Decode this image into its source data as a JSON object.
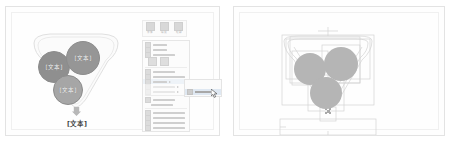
{
  "app": {
    "background_color": "#ffffff",
    "panel_background": "#fefefe",
    "panel_border_color": "#e3e3e3"
  },
  "left_panel": {
    "name": "slide-editing-view",
    "diagram": {
      "type": "funnel-smartart",
      "shape_fill": "#9a9a9a",
      "bubbles": [
        {
          "label": "[文本]",
          "fill": "#8f8f8f"
        },
        {
          "label": "[文本]",
          "fill": "#969696"
        },
        {
          "label": "[文本]",
          "fill": "#a6a6a6"
        }
      ],
      "arrow": {
        "icon": "arrow-down-icon",
        "fill": "#b0b0b0"
      },
      "bottom_label": "[文本]"
    },
    "mini_toolbar": {
      "items": [
        {
          "icon": "font-color-icon",
          "label": "字体"
        },
        {
          "icon": "shape-fill-icon",
          "label": "填充"
        },
        {
          "icon": "shape-outline-icon",
          "label": "轮廓"
        }
      ]
    },
    "context_menu": {
      "paste_options_label": "粘贴选项:",
      "paste_icons": [
        "paste-keep-formatting-icon",
        "paste-picture-icon"
      ],
      "items": [
        {
          "icon": "cut-icon",
          "label": "剪切(T)",
          "width": "s",
          "state": "normal"
        },
        {
          "icon": "copy-icon",
          "label": "复制(C)",
          "width": "s",
          "state": "normal"
        },
        {
          "icon": "paste-icon",
          "label": "粘贴选项:",
          "width": "m",
          "state": "normal"
        },
        {
          "icon": "edit-text-icon",
          "label": "编辑文字(X)",
          "width": "m",
          "state": "normal"
        },
        {
          "icon": "edit-points-icon",
          "label": "编辑顶点(E)",
          "width": "l",
          "state": "normal"
        },
        {
          "icon": "group-icon",
          "label": "组合(G)",
          "width": "s",
          "state": "normal",
          "has_submenu": true,
          "selected": true
        },
        {
          "icon": "bring-to-front-icon",
          "label": "置于顶层(R)",
          "width": "m",
          "state": "disabled",
          "has_submenu": true
        },
        {
          "icon": "send-to-back-icon",
          "label": "置于底层(K)",
          "width": "m",
          "state": "disabled",
          "has_submenu": true
        },
        {
          "icon": "hyperlink-icon",
          "label": "超链接(I)...",
          "width": "m",
          "state": "normal"
        },
        {
          "icon": "smart-lookup-icon",
          "label": "智能查找(L)",
          "width": "m",
          "state": "normal"
        },
        {
          "icon": "save-as-picture-icon",
          "label": "另存为图片(S)...",
          "width": "l",
          "state": "normal"
        },
        {
          "icon": "set-default-shape-icon",
          "label": "设置为默认形状(D)",
          "width": "l",
          "state": "normal"
        },
        {
          "icon": "size-position-icon",
          "label": "大小和位置(Z)...",
          "width": "l",
          "state": "normal"
        },
        {
          "icon": "format-shape-icon",
          "label": "设置形状格式(O)...",
          "width": "l",
          "state": "normal"
        }
      ],
      "submenu": {
        "items": [
          {
            "icon": "group-shapes-icon",
            "label": "组合(G)",
            "selected": true
          }
        ],
        "cursor": "mouse-pointer-icon"
      }
    }
  },
  "right_panel": {
    "name": "wireframe-selection-view",
    "diagram": {
      "type": "funnel-smartart-wireframe",
      "circle_fill": "#b5b5b5",
      "guide_color": "#cfcfcf",
      "selection_handle_color": "#9f9f9f",
      "circles": 3,
      "has_bounding_boxes": true,
      "has_bottom_textbox": true
    }
  }
}
